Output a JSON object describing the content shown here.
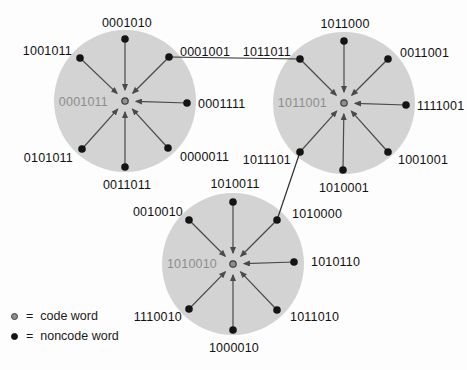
{
  "colors": {
    "background": "#fdfdfd",
    "sphere_fill": "#d3d3d3",
    "noncode_dot": "#141414",
    "code_dot_fill": "#8f8f8f",
    "code_dot_ring": "#3c3c3c",
    "arrow": "#4a4a4a",
    "connector": "#2e2e2e",
    "code_label": "#8d8d8d",
    "word_label": "#111111"
  },
  "legend": {
    "items": [
      {
        "symbol": "code-word-dot",
        "text": "=  code word"
      },
      {
        "symbol": "noncode-word-dot",
        "text": "=  noncode word"
      }
    ]
  },
  "spheres": [
    {
      "code_word": "0001011",
      "cx": 125,
      "cy": 101,
      "r": 71,
      "label_x": 108,
      "label_y": 106,
      "satellites": [
        {
          "word": "0001010",
          "x": 125,
          "y": 39,
          "lx": 127,
          "ly": 27,
          "anchor": "middle"
        },
        {
          "word": "0001001",
          "x": 169,
          "y": 57,
          "lx": 180,
          "ly": 56,
          "anchor": "start"
        },
        {
          "word": "0001111",
          "x": 187,
          "y": 103,
          "lx": 198,
          "ly": 108,
          "anchor": "start"
        },
        {
          "word": "0000011",
          "x": 168,
          "y": 148,
          "lx": 180,
          "ly": 161,
          "anchor": "start"
        },
        {
          "word": "0011011",
          "x": 125,
          "y": 167,
          "lx": 127,
          "ly": 189,
          "anchor": "middle"
        },
        {
          "word": "0101011",
          "x": 82,
          "y": 149,
          "lx": 73,
          "ly": 162,
          "anchor": "end"
        },
        {
          "word": "1001011",
          "x": 80,
          "y": 58,
          "lx": 72,
          "ly": 55,
          "anchor": "end"
        }
      ]
    },
    {
      "code_word": "1011001",
      "cx": 344,
      "cy": 103,
      "r": 71,
      "label_x": 327,
      "label_y": 107,
      "satellites": [
        {
          "word": "1011000",
          "x": 344,
          "y": 41,
          "lx": 345,
          "ly": 28,
          "anchor": "middle"
        },
        {
          "word": "0011001",
          "x": 388,
          "y": 59,
          "lx": 400,
          "ly": 57,
          "anchor": "start"
        },
        {
          "word": "1111001",
          "x": 406,
          "y": 105,
          "lx": 417,
          "ly": 110,
          "anchor": "start"
        },
        {
          "word": "1001001",
          "x": 388,
          "y": 152,
          "lx": 398,
          "ly": 164,
          "anchor": "start"
        },
        {
          "word": "1010001",
          "x": 343,
          "y": 170,
          "lx": 344,
          "ly": 192,
          "anchor": "middle"
        },
        {
          "word": "1011101",
          "x": 300,
          "y": 152,
          "lx": 291,
          "ly": 164,
          "anchor": "end"
        },
        {
          "word": "1011011",
          "x": 300,
          "y": 59,
          "lx": 291,
          "ly": 56,
          "anchor": "end"
        }
      ]
    },
    {
      "code_word": "1010010",
      "cx": 233,
      "cy": 264,
      "r": 71,
      "label_x": 217,
      "label_y": 268,
      "satellites": [
        {
          "word": "1010011",
          "x": 233,
          "y": 202,
          "lx": 235,
          "ly": 188,
          "anchor": "middle"
        },
        {
          "word": "1010000",
          "x": 277,
          "y": 220,
          "lx": 292,
          "ly": 218,
          "anchor": "start"
        },
        {
          "word": "1010110",
          "x": 294,
          "y": 262,
          "lx": 311,
          "ly": 266,
          "anchor": "start"
        },
        {
          "word": "1011010",
          "x": 277,
          "y": 310,
          "lx": 290,
          "ly": 321,
          "anchor": "start"
        },
        {
          "word": "1000010",
          "x": 233,
          "y": 330,
          "lx": 234,
          "ly": 352,
          "anchor": "middle"
        },
        {
          "word": "1110010",
          "x": 189,
          "y": 309,
          "lx": 182,
          "ly": 321,
          "anchor": "end"
        },
        {
          "word": "0010010",
          "x": 189,
          "y": 220,
          "lx": 183,
          "ly": 216,
          "anchor": "end"
        }
      ]
    }
  ],
  "connectors": [
    {
      "x1": 169,
      "y1": 57,
      "x2": 300,
      "y2": 59
    },
    {
      "x1": 300,
      "y1": 152,
      "x2": 277,
      "y2": 220
    }
  ]
}
